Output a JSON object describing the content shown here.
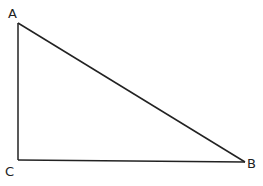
{
  "diagram": {
    "type": "right-triangle",
    "vertices": [
      {
        "label": "A",
        "x": 18,
        "y": 23,
        "label_x": 8,
        "label_y": 18
      },
      {
        "label": "C",
        "x": 18,
        "y": 160,
        "label_x": 5,
        "label_y": 176
      },
      {
        "label": "B",
        "x": 245,
        "y": 162,
        "label_x": 247,
        "label_y": 168
      }
    ],
    "edges": [
      {
        "from": "A",
        "to": "C"
      },
      {
        "from": "C",
        "to": "B"
      },
      {
        "from": "A",
        "to": "B"
      }
    ],
    "right_angle_at": "C",
    "stroke_color": "#222222"
  }
}
